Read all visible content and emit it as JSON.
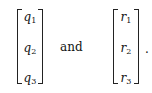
{
  "expression": {
    "left_vector": [
      {
        "symbol": "q",
        "index": "1"
      },
      {
        "symbol": "q",
        "index": "2"
      },
      {
        "symbol": "q",
        "index": "3"
      }
    ],
    "connector": "and",
    "right_vector": [
      {
        "symbol": "r",
        "index": "1"
      },
      {
        "symbol": "r",
        "index": "2"
      },
      {
        "symbol": "r",
        "index": "3"
      }
    ],
    "terminal_punctuation": "."
  }
}
